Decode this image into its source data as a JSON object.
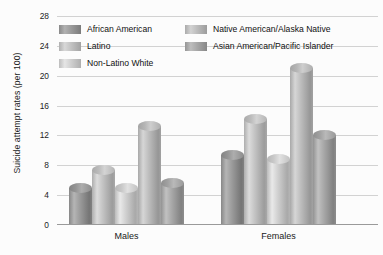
{
  "chart_data": {
    "type": "bar",
    "title": "",
    "xlabel": "",
    "ylabel": "Suicide attempt rates (per 100)",
    "categories": [
      "Males",
      "Females"
    ],
    "ylim": [
      0,
      28
    ],
    "yticks": [
      0,
      4,
      8,
      12,
      16,
      20,
      24,
      28
    ],
    "grid": true,
    "legend_position": "top-inside",
    "series": [
      {
        "name": "African American",
        "values": [
          5.0,
          9.4
        ],
        "color": "#8f8f8f"
      },
      {
        "name": "Latino",
        "values": [
          7.4,
          14.2
        ],
        "color": "#b6b6b6"
      },
      {
        "name": "Non-Latino White",
        "values": [
          5.0,
          8.9
        ],
        "color": "#c3c3c3"
      },
      {
        "name": "Native American/Alaska Native",
        "values": [
          13.2,
          21.0
        ],
        "color": "#b0b0b0"
      },
      {
        "name": "Asian American/Pacific Islander",
        "values": [
          5.6,
          12.0
        ],
        "color": "#9b9b9b"
      }
    ]
  },
  "axis": {
    "y_title": "Suicide attempt rates (per 100)",
    "tick_labels": [
      "0",
      "4",
      "8",
      "12",
      "16",
      "20",
      "24",
      "28"
    ],
    "category_labels": [
      "Males",
      "Females"
    ]
  },
  "legend": {
    "items": [
      {
        "label": "African American"
      },
      {
        "label": "Latino"
      },
      {
        "label": "Non-Latino White"
      },
      {
        "label": "Native American/Alaska Native"
      },
      {
        "label": "Asian American/Pacific Islander"
      }
    ]
  },
  "colors": {
    "gridline": "#d2d2d2",
    "baseline": "#9a9a9a",
    "background": "#fcfcfc",
    "text": "#1a1a1a"
  }
}
